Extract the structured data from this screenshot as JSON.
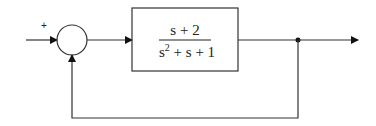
{
  "diagram": {
    "type": "feedback-block-diagram",
    "summing_junction": {
      "input_sign": "+"
    },
    "block": {
      "numerator": "s + 2",
      "denominator_base": "s",
      "denominator_exp": "2",
      "denominator_rest": " + s + 1"
    },
    "colors": {
      "line": "#333333",
      "background": "#ffffff"
    }
  }
}
